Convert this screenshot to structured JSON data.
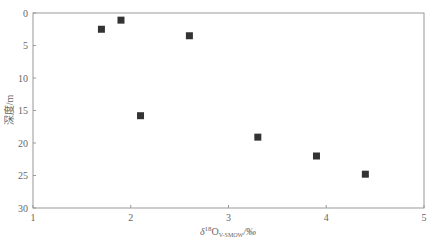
{
  "chart_data": {
    "type": "scatter",
    "title": "",
    "xlabel": "δ¹⁸O V-SMOW/‰",
    "xlabel_main": "δ",
    "xlabel_sup": "18",
    "xlabel_o": "O",
    "xlabel_sub": "V-SMOW",
    "xlabel_unit": "/‰",
    "ylabel": "深度/m",
    "xlim": [
      1,
      5
    ],
    "ylim": [
      30,
      0
    ],
    "y_inverted": true,
    "x_ticks": [
      1,
      2,
      3,
      4,
      5
    ],
    "y_ticks": [
      0,
      5,
      10,
      15,
      20,
      25,
      30
    ],
    "grid": false,
    "marker": "square",
    "marker_color": "#333333",
    "series": [
      {
        "name": "samples",
        "points": [
          {
            "x": 1.7,
            "y": 2.5
          },
          {
            "x": 1.9,
            "y": 1.1
          },
          {
            "x": 2.6,
            "y": 3.5
          },
          {
            "x": 2.1,
            "y": 15.8
          },
          {
            "x": 3.3,
            "y": 19.1
          },
          {
            "x": 3.9,
            "y": 22.0
          },
          {
            "x": 4.4,
            "y": 24.8
          }
        ]
      }
    ]
  }
}
